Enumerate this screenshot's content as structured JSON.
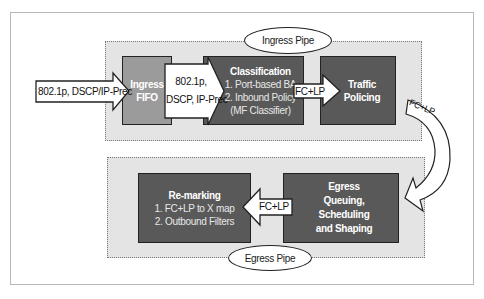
{
  "diagram": {
    "ingress_pipe": {
      "label": "Ingress Pipe",
      "input_arrow": "802.1p, DSCP/IP-Prec",
      "fifo": {
        "line1": "Ingress",
        "line2": "FIFO"
      },
      "arrow_to_classification": {
        "line1": "802.1p,",
        "line2": "DSCP, IP-Prec"
      },
      "classification": {
        "title": "Classification",
        "item1": "1. Port-based BA",
        "item2": "2. Inbound Policy",
        "item3": "(MF Classifier)"
      },
      "arrow_to_policing": "FC+LP",
      "policing": {
        "line1": "Traffic",
        "line2": "Policing"
      }
    },
    "curved_arrow": "FC+LP",
    "egress_pipe": {
      "label": "Egress Pipe",
      "queuing": {
        "line1": "Egress",
        "line2": "Queuing,",
        "line3": "Scheduling",
        "line4": "and Shaping"
      },
      "arrow_to_remarking": "FC+LP",
      "remarking": {
        "title": "Re-marking",
        "item1": "1. FC+LP to X map",
        "item2": "2. Outbound Filters"
      }
    }
  },
  "colors": {
    "pipe_bg": "#e4e4e4",
    "fifo": "#9b9b9b",
    "dark_box": "#595959",
    "arrow_fill": "#ffffff"
  }
}
